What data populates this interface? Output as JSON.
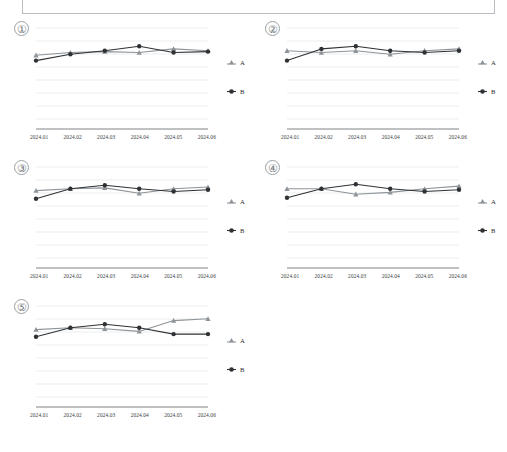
{
  "page": {
    "top_box": {
      "label": ""
    }
  },
  "legend": {
    "series": [
      {
        "key": "A",
        "label": "A",
        "marker": "triangle-marker-icon",
        "color": "#8e9499"
      },
      {
        "key": "B",
        "label": "B",
        "marker": "circle-marker-icon",
        "color": "#2f3235"
      }
    ]
  },
  "chart_data": [
    {
      "type": "line",
      "title": "①",
      "index_label": "①",
      "xlabel": "",
      "ylabel": "",
      "grid": true,
      "legend_position": "right",
      "ylim": [
        0,
        100
      ],
      "categories": [
        "2024.01",
        "2024.02",
        "2024.03",
        "2024.04",
        "2024.05",
        "2024.06"
      ],
      "series": [
        {
          "name": "A",
          "values": [
            72,
            75,
            76,
            75,
            79,
            77
          ]
        },
        {
          "name": "B",
          "values": [
            66,
            73,
            77,
            82,
            75,
            76
          ]
        }
      ]
    },
    {
      "type": "line",
      "title": "②",
      "index_label": "②",
      "xlabel": "",
      "ylabel": "",
      "grid": true,
      "legend_position": "right",
      "ylim": [
        0,
        100
      ],
      "categories": [
        "2024.01",
        "2024.02",
        "2024.03",
        "2024.04",
        "2024.05",
        "2024.06"
      ],
      "series": [
        {
          "name": "A",
          "values": [
            77,
            75,
            77,
            73,
            77,
            79
          ]
        },
        {
          "name": "B",
          "values": [
            66,
            79,
            82,
            77,
            75,
            77
          ]
        }
      ]
    },
    {
      "type": "line",
      "title": "③",
      "index_label": "③",
      "xlabel": "",
      "ylabel": "",
      "grid": true,
      "legend_position": "right",
      "ylim": [
        0,
        100
      ],
      "categories": [
        "2024.01",
        "2024.02",
        "2024.03",
        "2024.04",
        "2024.05",
        "2024.06"
      ],
      "series": [
        {
          "name": "A",
          "values": [
            76,
            78,
            79,
            73,
            78,
            80
          ]
        },
        {
          "name": "B",
          "values": [
            67,
            78,
            82,
            78,
            75,
            77
          ]
        }
      ]
    },
    {
      "type": "line",
      "title": "④",
      "index_label": "④",
      "xlabel": "",
      "ylabel": "",
      "grid": true,
      "legend_position": "right",
      "ylim": [
        0,
        100
      ],
      "categories": [
        "2024.01",
        "2024.02",
        "2024.03",
        "2024.04",
        "2024.05",
        "2024.06"
      ],
      "series": [
        {
          "name": "A",
          "values": [
            78,
            78,
            72,
            74,
            78,
            81
          ]
        },
        {
          "name": "B",
          "values": [
            68,
            78,
            83,
            78,
            75,
            77
          ]
        }
      ]
    },
    {
      "type": "line",
      "title": "⑤",
      "index_label": "⑤",
      "xlabel": "",
      "ylabel": "",
      "grid": true,
      "legend_position": "right",
      "ylim": [
        0,
        100
      ],
      "categories": [
        "2024.01",
        "2024.02",
        "2024.03",
        "2024.04",
        "2024.05",
        "2024.06"
      ],
      "series": [
        {
          "name": "A",
          "values": [
            76,
            78,
            77,
            74,
            86,
            88
          ]
        },
        {
          "name": "B",
          "values": [
            68,
            78,
            82,
            78,
            71,
            71
          ]
        }
      ]
    }
  ]
}
